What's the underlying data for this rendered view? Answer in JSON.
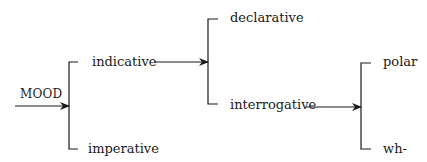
{
  "diagram": {
    "entry": {
      "label": "MOOD"
    },
    "systems": [
      {
        "name": "mood",
        "options": [
          "indicative",
          "imperative"
        ]
      },
      {
        "name": "indicative-type",
        "entry_from": "indicative",
        "options": [
          "declarative",
          "interrogative"
        ]
      },
      {
        "name": "interrogative-type",
        "entry_from": "interrogative",
        "options": [
          "polar",
          "wh-"
        ]
      }
    ],
    "labels": {
      "mood": "MOOD",
      "indicative": "indicative",
      "imperative": "imperative",
      "declarative": "declarative",
      "interrogative": "interrogative",
      "polar": "polar",
      "wh": "wh-"
    },
    "colors": {
      "line": "#1a1a1a",
      "background": "#ffffff"
    }
  }
}
